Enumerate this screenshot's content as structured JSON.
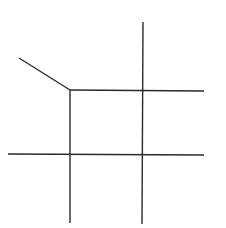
{
  "diagram": {
    "background": "#ffffff",
    "stroke_color": "#2a2a2a",
    "stroke_width": 1.4,
    "segments": [
      {
        "name": "diagonal-edge",
        "x1": 19,
        "y1": 58,
        "x2": 70,
        "y2": 90
      },
      {
        "name": "top-horizontal-edge",
        "x1": 70,
        "y1": 90,
        "x2": 204,
        "y2": 91
      },
      {
        "name": "left-vertical-edge",
        "x1": 70,
        "y1": 90,
        "x2": 70,
        "y2": 223
      },
      {
        "name": "right-vertical-edge",
        "x1": 143,
        "y1": 22,
        "x2": 142,
        "y2": 224
      },
      {
        "name": "bottom-horizontal-edge",
        "x1": 8,
        "y1": 154,
        "x2": 204,
        "y2": 155
      }
    ]
  }
}
